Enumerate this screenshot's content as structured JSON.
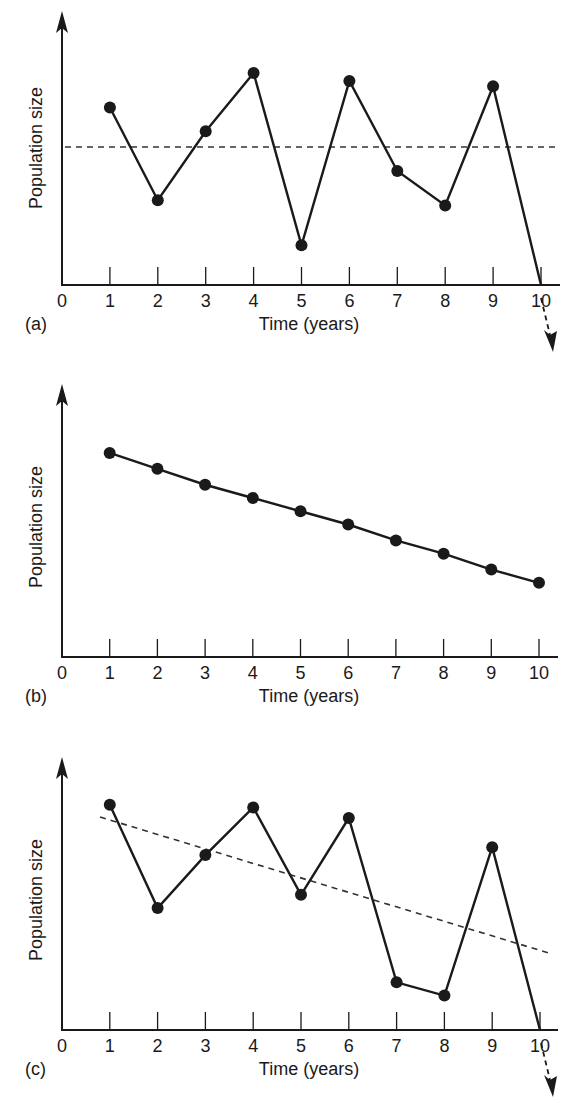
{
  "figure": {
    "x_axis_title": "Time (years)",
    "y_axis_title": "Population size",
    "x_tick_labels": [
      "0",
      "1",
      "2",
      "3",
      "4",
      "5",
      "6",
      "7",
      "8",
      "9",
      "10"
    ]
  },
  "panels": [
    {
      "label": "(a)",
      "x_axis_title": "Time (years)",
      "y_axis_title": "Population size"
    },
    {
      "label": "(b)",
      "x_axis_title": "Time (years)",
      "y_axis_title": "Population size"
    },
    {
      "label": "(c)",
      "x_axis_title": "Time (years)",
      "y_axis_title": "Population size"
    }
  ],
  "chart_data": [
    {
      "type": "line",
      "panel": "(a)",
      "title": "",
      "xlabel": "Time (years)",
      "ylabel": "Population size",
      "x": [
        1,
        2,
        3,
        4,
        5,
        6,
        7,
        8,
        9,
        10
      ],
      "series": [
        {
          "name": "Population",
          "values": [
            0.67,
            0.32,
            0.58,
            0.8,
            0.15,
            0.77,
            0.43,
            0.3,
            0.75,
            0.0
          ],
          "style": "solid-with-markers",
          "continues_below_axis_after_x10": true
        },
        {
          "name": "Mean level",
          "values": [
            0.51,
            0.51,
            0.51,
            0.51,
            0.51,
            0.51,
            0.51,
            0.51,
            0.51,
            0.51
          ],
          "style": "dashed",
          "x_range": [
            0.1,
            10.4
          ]
        }
      ],
      "xlim": [
        0,
        10.4
      ],
      "ylim": [
        0,
        1
      ],
      "x_tick_labels": [
        "0",
        "1",
        "2",
        "3",
        "4",
        "5",
        "6",
        "7",
        "8",
        "9",
        "10"
      ],
      "y_ticks": "none",
      "grid": false,
      "legend": "none",
      "annotations": [
        "dashed arrow continuing downward past x=10"
      ]
    },
    {
      "type": "line",
      "panel": "(b)",
      "title": "",
      "xlabel": "Time (years)",
      "ylabel": "Population size",
      "x": [
        1,
        2,
        3,
        4,
        5,
        6,
        7,
        8,
        9,
        10
      ],
      "series": [
        {
          "name": "Population",
          "values": [
            0.77,
            0.71,
            0.65,
            0.6,
            0.55,
            0.5,
            0.44,
            0.39,
            0.33,
            0.28
          ],
          "style": "solid-with-markers"
        }
      ],
      "xlim": [
        0,
        10.4
      ],
      "ylim": [
        0,
        1
      ],
      "x_tick_labels": [
        "0",
        "1",
        "2",
        "3",
        "4",
        "5",
        "6",
        "7",
        "8",
        "9",
        "10"
      ],
      "y_ticks": "none",
      "grid": false,
      "legend": "none"
    },
    {
      "type": "line",
      "panel": "(c)",
      "title": "",
      "xlabel": "Time (years)",
      "ylabel": "Population size",
      "x": [
        1,
        2,
        3,
        4,
        5,
        6,
        7,
        8,
        9,
        10
      ],
      "series": [
        {
          "name": "Population",
          "values": [
            0.85,
            0.46,
            0.66,
            0.84,
            0.51,
            0.8,
            0.18,
            0.13,
            0.69,
            0.0
          ],
          "style": "solid-with-markers",
          "continues_below_axis_after_x10": true
        },
        {
          "name": "Declining trend",
          "style": "dashed",
          "x": [
            0.8,
            10.3
          ],
          "values": [
            0.79,
            0.28
          ]
        }
      ],
      "xlim": [
        0,
        10.4
      ],
      "ylim": [
        0,
        1
      ],
      "x_tick_labels": [
        "0",
        "1",
        "2",
        "3",
        "4",
        "5",
        "6",
        "7",
        "8",
        "9",
        "10"
      ],
      "y_ticks": "none",
      "grid": false,
      "legend": "none",
      "annotations": [
        "dashed arrow continuing downward past x=10"
      ]
    }
  ]
}
